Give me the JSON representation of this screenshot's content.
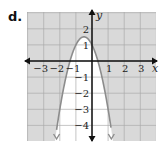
{
  "problem_label": "d.",
  "colors": {
    "shaded": "#d9d9d9",
    "unshaded": "#ffffff",
    "grid": "#a8a8a8",
    "curve": "#8c8c8c",
    "axis": "#111111"
  },
  "chart_data": {
    "type": "line",
    "title": "",
    "function": "y = -2(x + 0.5)^2 + 1.5",
    "vertex": [
      -0.5,
      1.5
    ],
    "y_intercept": 1,
    "x_intercepts": [
      -1.37,
      0.37
    ],
    "shaded_region": "outside parabola",
    "xlabel": "x",
    "ylabel": "y",
    "xlim": [
      -4,
      4
    ],
    "ylim": [
      -5,
      3
    ],
    "x_ticks": [
      -3,
      -2,
      -1,
      1,
      2,
      3
    ],
    "y_ticks": [
      2,
      1,
      -1,
      -2,
      -3,
      -4
    ],
    "x_tick_labels": [
      "−3",
      "−2",
      "−1",
      "1",
      "2",
      "3"
    ],
    "y_tick_labels": [
      "2",
      "1",
      "−1",
      "−2",
      "−3",
      "−4"
    ],
    "grid": true,
    "legend": null
  }
}
